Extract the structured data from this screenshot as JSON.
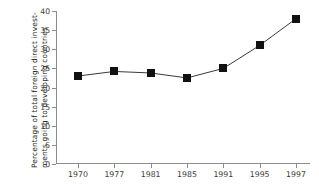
{
  "chart_data": {
    "type": "line",
    "title": "",
    "xlabel": "",
    "ylabel": "Percentage of total foreign direct invest-ments going to developing countries",
    "ylabel_lines": [
      "Percentage of total foreign direct invest-",
      "ments going to developing countries"
    ],
    "categories": [
      "1970",
      "1977",
      "1981",
      "1985",
      "1991",
      "1995",
      "1997"
    ],
    "values": [
      23.0,
      24.2,
      23.8,
      22.5,
      25.0,
      31.0,
      38.0
    ],
    "yticks": [
      0,
      5,
      10,
      15,
      20,
      25,
      30,
      35,
      40
    ],
    "ytick_labels": [
      "0",
      "5",
      "10",
      "15",
      "20",
      "25",
      "30",
      "35",
      "40"
    ],
    "ylim": [
      0,
      40
    ],
    "grid": false,
    "legend": "none",
    "marker": "square",
    "marker_color": "#111111",
    "line_color": "#3a3a3a",
    "axis_color": "#8c8c8c",
    "background_color": "#ffffff"
  }
}
